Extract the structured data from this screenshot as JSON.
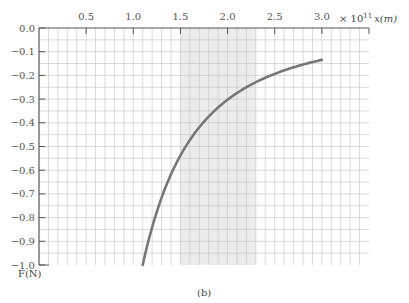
{
  "chart_data": {
    "type": "line",
    "title": "",
    "caption": "(b)",
    "xlabel": "x(m)",
    "x_multiplier": "× 10",
    "x_multiplier_exp": "11",
    "ylabel": "F(N)",
    "xlim": [
      0,
      3.5
    ],
    "ylim": [
      -1.0,
      0.0
    ],
    "grid": true,
    "x_ticks": [
      0.5,
      1.0,
      1.5,
      2.0,
      2.5,
      3.0
    ],
    "x_tick_labels": [
      "0.5",
      "1.0",
      "1.5",
      "2.0",
      "2.5",
      "3.0"
    ],
    "y_ticks": [
      0.0,
      -0.1,
      -0.2,
      -0.3,
      -0.4,
      -0.5,
      -0.6,
      -0.7,
      -0.8,
      -0.9,
      -1.0
    ],
    "y_tick_labels": [
      "0.0",
      "−0.1",
      "−0.2",
      "−0.3",
      "−0.4",
      "−0.5",
      "−0.6",
      "−0.7",
      "−0.8",
      "−0.9",
      "−1.0"
    ],
    "shaded_region": {
      "x_from": 1.5,
      "x_to": 2.3,
      "color": "#ececec"
    },
    "series": [
      {
        "name": "F(x)",
        "color": "#777777",
        "x": [
          1.1,
          1.2,
          1.3,
          1.4,
          1.5,
          1.6,
          1.8,
          2.0,
          2.2,
          2.4,
          2.6,
          2.8,
          3.0
        ],
        "y": [
          -1.0,
          -0.84,
          -0.716,
          -0.617,
          -0.538,
          -0.473,
          -0.373,
          -0.303,
          -0.25,
          -0.21,
          -0.179,
          -0.154,
          -0.134
        ]
      }
    ]
  },
  "colors": {
    "grid": "#c8c8c8",
    "axis": "#555555",
    "curve": "#777777",
    "shade": "#ececec"
  }
}
